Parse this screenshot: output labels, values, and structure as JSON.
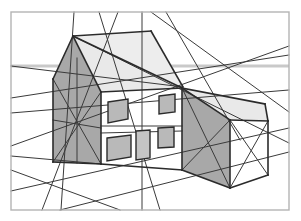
{
  "drawing": {
    "title": "Two-Point Perspective House Construction Drawing",
    "type": "architectural-perspective-sketch",
    "canvas": {
      "width": 301,
      "height": 221,
      "background": "#ffffff"
    },
    "frame": {
      "name": "drawing-border",
      "x": 11,
      "y": 12,
      "width": 278,
      "height": 198,
      "stroke": "#b4b4b4",
      "stroke_width": 1.4,
      "fill": "none"
    },
    "horizon_line": {
      "name": "horizon-line",
      "label": "Horizon / Eye level",
      "y": 66,
      "x1": 11,
      "x2": 289,
      "stroke": "#c9c9c9",
      "stroke_width": 3
    },
    "vanishing_points": [
      {
        "name": "vanishing-point-left",
        "x": -240,
        "y": 66
      },
      {
        "name": "vanishing-point-right",
        "x": 560,
        "y": 66
      },
      {
        "name": "vanishing-point-vertical",
        "x": 142,
        "y": 66
      }
    ],
    "palette": {
      "outline": "#2b2b2b",
      "construction": "#3a3a3a",
      "frame": "#b4b4b4",
      "horizon": "#c9c9c9",
      "wall_shadow": "#a8a8a8",
      "wall_light": "#ffffff",
      "roof_light": "#e9e9e9",
      "roof_mid": "#dcdcdc",
      "window_fill": "#b9b9b9",
      "window_stroke": "#2b2b2b"
    },
    "faces": [
      {
        "name": "gable-end-wall",
        "description": "Left gable end wall in shadow",
        "fill": "#a8a8a8",
        "points": "73,36 101,92 101,164 53,162 53,79"
      },
      {
        "name": "roof-plane-front",
        "description": "Main roof slope facing viewer right",
        "fill": "#e9e9e9",
        "points": "73,36 182,88 101,92"
      },
      {
        "name": "roof-plane-back",
        "description": "Far roof plane above ridge",
        "fill": "#ededed",
        "points": "73,36 151,31 183,87 182,88"
      },
      {
        "name": "front-facade",
        "description": "Main front wall of house (lit)",
        "fill": "#ffffff",
        "points": "101,92 182,88 182,170 101,164"
      },
      {
        "name": "wing-end-wall",
        "description": "Right wing end wall in shadow",
        "fill": "#a8a8a8",
        "points": "182,88 230,120 230,188 182,170"
      },
      {
        "name": "wing-roof",
        "description": "Right wing flat roof top face",
        "fill": "#e9e9e9",
        "points": "182,88 265,104 268,121 230,120"
      }
    ],
    "solid_edges": [
      {
        "name": "edge-ridge-left",
        "x1": 73,
        "y1": 36,
        "x2": 53,
        "y2": 79
      },
      {
        "name": "edge-gable-left-vert",
        "x1": 53,
        "y1": 79,
        "x2": 53,
        "y2": 162
      },
      {
        "name": "edge-gable-base",
        "x1": 53,
        "y1": 162,
        "x2": 101,
        "y2": 164
      },
      {
        "name": "edge-gable-corner-vert",
        "x1": 101,
        "y1": 92,
        "x2": 101,
        "y2": 164
      },
      {
        "name": "edge-gable-slope-right",
        "x1": 73,
        "y1": 36,
        "x2": 101,
        "y2": 92
      },
      {
        "name": "edge-ridge-to-eave",
        "x1": 73,
        "y1": 36,
        "x2": 182,
        "y2": 88
      },
      {
        "name": "edge-eave-front",
        "x1": 101,
        "y1": 92,
        "x2": 182,
        "y2": 88
      },
      {
        "name": "edge-facade-base",
        "x1": 101,
        "y1": 164,
        "x2": 182,
        "y2": 170
      },
      {
        "name": "edge-facade-right-vert",
        "x1": 182,
        "y1": 88,
        "x2": 182,
        "y2": 170
      },
      {
        "name": "edge-ridge-back",
        "x1": 73,
        "y1": 36,
        "x2": 151,
        "y2": 31
      },
      {
        "name": "edge-back-slope",
        "x1": 151,
        "y1": 31,
        "x2": 183,
        "y2": 87
      },
      {
        "name": "edge-wing-top-front",
        "x1": 182,
        "y1": 88,
        "x2": 265,
        "y2": 104
      },
      {
        "name": "edge-wing-top-back",
        "x1": 230,
        "y1": 120,
        "x2": 268,
        "y2": 121
      },
      {
        "name": "edge-wing-corner-vert",
        "x1": 230,
        "y1": 120,
        "x2": 230,
        "y2": 188
      },
      {
        "name": "edge-wing-base-left",
        "x1": 182,
        "y1": 170,
        "x2": 230,
        "y2": 188
      },
      {
        "name": "edge-wing-base-right",
        "x1": 230,
        "y1": 188,
        "x2": 268,
        "y2": 175
      },
      {
        "name": "edge-wing-far-vert",
        "x1": 268,
        "y1": 121,
        "x2": 268,
        "y2": 175
      },
      {
        "name": "edge-wing-top-diag",
        "x1": 182,
        "y1": 88,
        "x2": 230,
        "y2": 120
      },
      {
        "name": "edge-wing-far-top",
        "x1": 265,
        "y1": 104,
        "x2": 268,
        "y2": 121
      }
    ],
    "construction_lines": [
      {
        "name": "guide-left-eave-extend",
        "x1": 11,
        "y1": 98,
        "x2": 289,
        "y2": 55
      },
      {
        "name": "guide-left-base-extend",
        "x1": 11,
        "y1": 146,
        "x2": 289,
        "y2": 46
      },
      {
        "name": "guide-right-eave-extend",
        "x1": 11,
        "y1": 113,
        "x2": 289,
        "y2": 90
      },
      {
        "name": "guide-right-base-extend",
        "x1": 11,
        "y1": 191,
        "x2": 289,
        "y2": 128
      },
      {
        "name": "guide-wing-lower-extend",
        "x1": 60,
        "y1": 210,
        "x2": 289,
        "y2": 152
      },
      {
        "name": "guide-ridge-extend-right",
        "x1": 73,
        "y1": 36,
        "x2": 289,
        "y2": 143
      },
      {
        "name": "guide-ridge-extend-left",
        "x1": 11,
        "y1": 66,
        "x2": 183,
        "y2": 87
      },
      {
        "name": "guide-steep-a",
        "x1": 74,
        "y1": 12,
        "x2": 61,
        "y2": 210
      },
      {
        "name": "guide-steep-b",
        "x1": 99,
        "y1": 12,
        "x2": 160,
        "y2": 210
      },
      {
        "name": "guide-steep-c",
        "x1": 118,
        "y1": 12,
        "x2": 42,
        "y2": 210
      },
      {
        "name": "guide-vertical-center",
        "x1": 142,
        "y1": 12,
        "x2": 142,
        "y2": 210
      },
      {
        "name": "guide-diag-top-right-a",
        "x1": 151,
        "y1": 12,
        "x2": 289,
        "y2": 112
      },
      {
        "name": "guide-diag-top-right-b",
        "x1": 166,
        "y1": 12,
        "x2": 240,
        "y2": 140
      },
      {
        "name": "guide-gable-x-a",
        "x1": 53,
        "y1": 79,
        "x2": 101,
        "y2": 164
      },
      {
        "name": "guide-gable-x-b",
        "x1": 53,
        "y1": 162,
        "x2": 101,
        "y2": 92
      },
      {
        "name": "guide-gable-mid-vert",
        "x1": 77,
        "y1": 58,
        "x2": 77,
        "y2": 163
      },
      {
        "name": "guide-gable-mid-horiz",
        "x1": 53,
        "y1": 120,
        "x2": 101,
        "y2": 128
      },
      {
        "name": "guide-wing-x-a",
        "x1": 182,
        "y1": 88,
        "x2": 230,
        "y2": 188
      },
      {
        "name": "guide-wing-x-b",
        "x1": 182,
        "y1": 170,
        "x2": 230,
        "y2": 120
      },
      {
        "name": "guide-wing-side-x-a",
        "x1": 230,
        "y1": 120,
        "x2": 268,
        "y2": 175
      },
      {
        "name": "guide-wing-side-x-b",
        "x1": 230,
        "y1": 188,
        "x2": 268,
        "y2": 121
      },
      {
        "name": "guide-facade-mid-band-top",
        "x1": 101,
        "y1": 126,
        "x2": 182,
        "y2": 126
      },
      {
        "name": "guide-facade-mid-band-bot",
        "x1": 101,
        "y1": 133,
        "x2": 182,
        "y2": 131
      },
      {
        "name": "guide-low-left-fan",
        "x1": 11,
        "y1": 156,
        "x2": 101,
        "y2": 164
      },
      {
        "name": "guide-low-right-fan",
        "x1": 11,
        "y1": 170,
        "x2": 120,
        "y2": 210
      }
    ],
    "windows": [
      {
        "name": "window-upper-left",
        "points": "108,102 128,99 128,119 108,123",
        "fill": "#b9b9b9"
      },
      {
        "name": "window-lower-left",
        "points": "107,138 131,135 131,157 107,161",
        "fill": "#b9b9b9"
      },
      {
        "name": "window-upper-right",
        "points": "159,96 175,94 175,112 159,114",
        "fill": "#b9b9b9"
      },
      {
        "name": "window-lower-right",
        "points": "158,128 174,127 174,147 158,148",
        "fill": "#b9b9b9"
      },
      {
        "name": "window-center-door",
        "points": "136,131 150,130 150,158 136,160",
        "fill": "#c4c4c4"
      }
    ],
    "legend": {
      "shaded_faces_label": "Shaded planes",
      "construction_label": "Construction guide lines",
      "horizon_label": "Horizon line"
    }
  }
}
